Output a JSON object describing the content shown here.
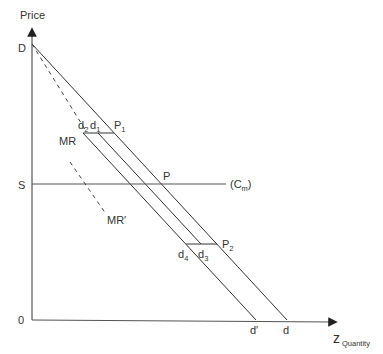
{
  "axes": {
    "y_label": "Price",
    "x_label": "Quantity",
    "x_end_label": "z",
    "origin_label": "0"
  },
  "points": {
    "D": "D",
    "S": "S",
    "P": "P",
    "P1": {
      "base": "P",
      "sub": "1"
    },
    "P2": {
      "base": "P",
      "sub": "2"
    },
    "d1": {
      "base": "d",
      "sub": "1"
    },
    "d2": {
      "base": "d",
      "sub": "2"
    },
    "d3": {
      "base": "d",
      "sub": "3"
    },
    "d4": {
      "base": "d",
      "sub": "4"
    },
    "d": "d",
    "d_prime": "d′"
  },
  "curves": {
    "MR": "MR",
    "MR_prime": "MR′",
    "Cm": {
      "open": "(C",
      "sub": "m",
      "close": ")"
    }
  },
  "colors": {
    "line": "#333333",
    "axis": "#555555",
    "background": "#ffffff"
  }
}
